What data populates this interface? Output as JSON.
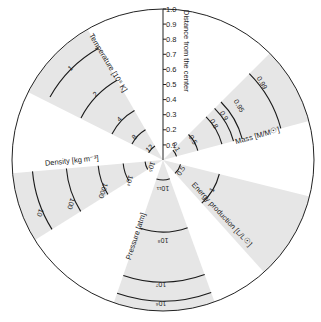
{
  "diagram": {
    "center": [
      163,
      160
    ],
    "radius": 151,
    "wedge_fill": "#e6e6e6",
    "line_color": "#1a1a1a",
    "axis": {
      "title": "Distance from the center",
      "ticks": [
        "0.1",
        "0.2",
        "0.3",
        "0.4",
        "0.5",
        "0.6",
        "0.7",
        "0.8",
        "0.9",
        "1.0"
      ]
    },
    "wedges": [
      {
        "id": "temperature",
        "title": "Temperature [10⁶ K]",
        "labels": [
          "1",
          "2",
          "4",
          "8",
          "12"
        ]
      },
      {
        "id": "density",
        "title": "Density [kg m⁻³]",
        "labels": [
          "10",
          "100",
          "1000",
          "10⁴",
          "10⁵"
        ]
      },
      {
        "id": "pressure",
        "title": "Pressure [atm]",
        "labels": [
          "10¹¹",
          "10⁸",
          "10⁷",
          "10⁶"
        ]
      },
      {
        "id": "energy",
        "title": "Energy production [L/L☉]",
        "labels": [
          "0.5",
          "1"
        ]
      },
      {
        "id": "mass",
        "title": "Mass [M/M☉]",
        "labels": [
          "0.1",
          "0.5",
          "0.8",
          "0.9",
          "0.95",
          "0.99"
        ]
      }
    ]
  }
}
